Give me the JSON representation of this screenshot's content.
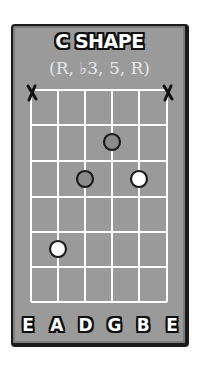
{
  "diagram": {
    "title": "C SHAPE",
    "subtitle": "(R, ♭3, 5, R)",
    "strings": [
      "E",
      "A",
      "D",
      "G",
      "B",
      "E"
    ],
    "muted_strings": [
      1,
      6
    ],
    "fret_rows": 6,
    "notes": [
      {
        "string": 4,
        "string_name": "G",
        "fret": 2,
        "type": "gray",
        "role": "interval"
      },
      {
        "string": 3,
        "string_name": "D",
        "fret": 3,
        "type": "gray",
        "role": "interval"
      },
      {
        "string": 5,
        "string_name": "B",
        "fret": 3,
        "type": "white",
        "role": "root"
      },
      {
        "string": 2,
        "string_name": "A",
        "fret": 5,
        "type": "white",
        "role": "root"
      }
    ],
    "colors": {
      "background": "#9a9a9a",
      "grid": "#ffffff",
      "border": "#1a1a1a",
      "root_dot": "#ffffff",
      "interval_dot": "#8a8a8a"
    }
  }
}
